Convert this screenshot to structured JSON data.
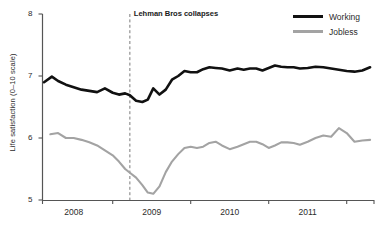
{
  "chart_data": {
    "type": "line",
    "title": "",
    "xlabel": "",
    "ylabel": "Life satisfaction (0–10 scale)",
    "ylim": [
      5,
      8
    ],
    "xlim": [
      2007.6,
      2011.85
    ],
    "yticks": [
      5,
      6,
      7,
      8
    ],
    "ytick_labels": [
      "5",
      "6",
      "7",
      "8"
    ],
    "xticks": [
      2008,
      2009,
      2010,
      2011
    ],
    "xtick_labels": [
      "2008",
      "2009",
      "2010",
      "2011"
    ],
    "grid": false,
    "legend_position": "top-right",
    "annotations": [
      {
        "label": "Lehman Bros collapses",
        "x": 2008.72,
        "style": "dashed-vertical-line"
      }
    ],
    "colors": {
      "working": "#111111",
      "jobless": "#a3a3a3",
      "axis": "#555555",
      "annotation_line": "#7a7a7a",
      "background": "#ffffff"
    },
    "series": [
      {
        "name": "Working",
        "color": "#111111",
        "x": [
          2007.62,
          2007.72,
          2007.8,
          2007.9,
          2008.0,
          2008.1,
          2008.2,
          2008.3,
          2008.4,
          2008.5,
          2008.58,
          2008.66,
          2008.72,
          2008.8,
          2008.88,
          2008.95,
          2009.02,
          2009.1,
          2009.18,
          2009.26,
          2009.34,
          2009.42,
          2009.5,
          2009.58,
          2009.66,
          2009.74,
          2009.82,
          2009.9,
          2010.0,
          2010.1,
          2010.18,
          2010.26,
          2010.34,
          2010.42,
          2010.5,
          2010.58,
          2010.66,
          2010.74,
          2010.82,
          2010.9,
          2011.0,
          2011.1,
          2011.2,
          2011.3,
          2011.4,
          2011.5,
          2011.6,
          2011.7,
          2011.8
        ],
        "y": [
          6.9,
          6.99,
          6.92,
          6.86,
          6.82,
          6.78,
          6.76,
          6.74,
          6.8,
          6.73,
          6.7,
          6.72,
          6.69,
          6.6,
          6.58,
          6.62,
          6.8,
          6.7,
          6.78,
          6.94,
          7.0,
          7.08,
          7.06,
          7.06,
          7.11,
          7.14,
          7.13,
          7.12,
          7.09,
          7.12,
          7.1,
          7.12,
          7.12,
          7.09,
          7.13,
          7.17,
          7.15,
          7.14,
          7.14,
          7.12,
          7.13,
          7.15,
          7.14,
          7.12,
          7.1,
          7.08,
          7.07,
          7.09,
          7.14
        ]
      },
      {
        "name": "Jobless",
        "color": "#a3a3a3",
        "x": [
          2007.7,
          2007.8,
          2007.9,
          2008.0,
          2008.1,
          2008.2,
          2008.3,
          2008.4,
          2008.5,
          2008.58,
          2008.66,
          2008.72,
          2008.8,
          2008.88,
          2008.95,
          2009.02,
          2009.1,
          2009.18,
          2009.26,
          2009.34,
          2009.42,
          2009.5,
          2009.58,
          2009.66,
          2009.74,
          2009.82,
          2009.9,
          2010.0,
          2010.1,
          2010.18,
          2010.26,
          2010.34,
          2010.42,
          2010.5,
          2010.58,
          2010.66,
          2010.74,
          2010.82,
          2010.9,
          2011.0,
          2011.1,
          2011.2,
          2011.3,
          2011.4,
          2011.5,
          2011.6,
          2011.7,
          2011.8
        ],
        "y": [
          6.06,
          6.08,
          6.0,
          6.0,
          5.97,
          5.93,
          5.88,
          5.8,
          5.72,
          5.62,
          5.5,
          5.44,
          5.36,
          5.24,
          5.12,
          5.1,
          5.22,
          5.45,
          5.62,
          5.74,
          5.84,
          5.86,
          5.84,
          5.86,
          5.92,
          5.94,
          5.88,
          5.82,
          5.86,
          5.9,
          5.94,
          5.94,
          5.9,
          5.84,
          5.88,
          5.93,
          5.93,
          5.92,
          5.89,
          5.94,
          6.0,
          6.04,
          6.02,
          6.16,
          6.08,
          5.94,
          5.96,
          5.97
        ]
      }
    ]
  },
  "legend": {
    "items": [
      {
        "label": "Working",
        "key": "working"
      },
      {
        "label": "Jobless",
        "key": "jobless"
      }
    ]
  }
}
